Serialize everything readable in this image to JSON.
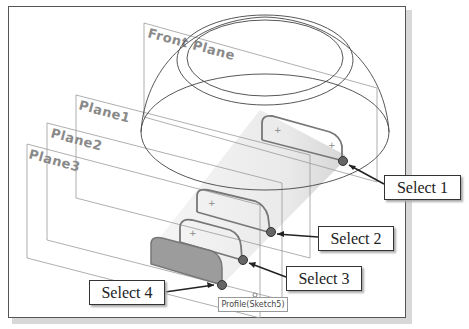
{
  "viewport": {
    "planes": [
      {
        "id": "front-plane",
        "label": "Front Plane"
      },
      {
        "id": "plane1",
        "label": "Plane1"
      },
      {
        "id": "plane2",
        "label": "Plane2"
      },
      {
        "id": "plane3",
        "label": "Plane3"
      }
    ],
    "tooltip": "Profile(Sketch5)"
  },
  "callouts": [
    {
      "label": "Select 1"
    },
    {
      "label": "Select 2"
    },
    {
      "label": "Select 3"
    },
    {
      "label": "Select 4"
    }
  ],
  "colors": {
    "plane_line": "#8a8a8a",
    "sketch_line": "#777777",
    "selected_profile_fill": "#9a9a9a",
    "select_point": "#555555"
  }
}
